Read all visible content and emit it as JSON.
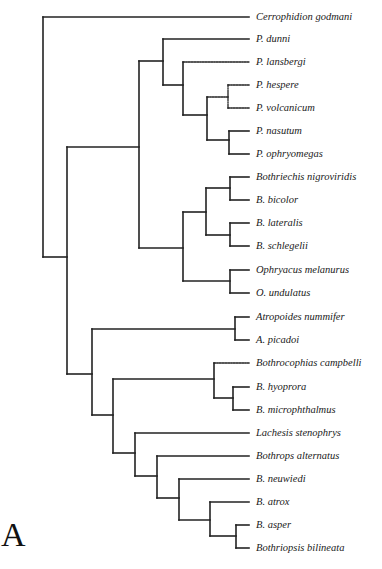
{
  "figure": {
    "panel_label": "A",
    "line_color": "#222222",
    "leaf_x_end": 249
  },
  "taxa": [
    {
      "name": "Cerrophidion godmani",
      "y": 17
    },
    {
      "name": "P. dunni",
      "y": 39
    },
    {
      "name": "P. lansbergi",
      "y": 62
    },
    {
      "name": "P. hespere",
      "y": 85
    },
    {
      "name": "P. volcanicum",
      "y": 108
    },
    {
      "name": "P. nasutum",
      "y": 131
    },
    {
      "name": "P. ophryomegas",
      "y": 154
    },
    {
      "name": "Bothriechis nigroviridis",
      "y": 177
    },
    {
      "name": "B. bicolor",
      "y": 200
    },
    {
      "name": "B. lateralis",
      "y": 223
    },
    {
      "name": "B. schlegelii",
      "y": 246
    },
    {
      "name": "Ophryacus melanurus",
      "y": 270
    },
    {
      "name": "O. undulatus",
      "y": 293
    },
    {
      "name": "Atropoides nummifer",
      "y": 317
    },
    {
      "name": "A. picadoi",
      "y": 340
    },
    {
      "name": "Bothrocophias campbelli",
      "y": 363
    },
    {
      "name": "B. hyoprora",
      "y": 387
    },
    {
      "name": "B. microphthalmus",
      "y": 410
    },
    {
      "name": "Lachesis stenophrys",
      "y": 433
    },
    {
      "name": "Bothrops alternatus",
      "y": 456
    },
    {
      "name": "B. neuwiedi",
      "y": 479
    },
    {
      "name": "B. atrox",
      "y": 502
    },
    {
      "name": "B. asper",
      "y": 525
    },
    {
      "name": "Bothriopsis bilineata",
      "y": 548
    }
  ],
  "nodes": [
    {
      "id": "root",
      "x": 43,
      "y1": 17,
      "y2": 257,
      "dotted": false
    },
    {
      "id": "n_ingroup",
      "x": 67,
      "y1": 147,
      "y2": 374,
      "dotted": false
    },
    {
      "id": "n_upper",
      "x": 139,
      "y1": 61,
      "y2": 248,
      "dotted": false
    },
    {
      "id": "n_porth",
      "x": 163,
      "y1": 39,
      "y2": 85,
      "dotted": false
    },
    {
      "id": "n_porth2",
      "x": 183,
      "y1": 62,
      "y2": 115,
      "dotted": false
    },
    {
      "id": "n_porth3",
      "x": 207,
      "y1": 97,
      "y2": 140,
      "dotted": false
    },
    {
      "id": "n_hesp",
      "x": 228,
      "y1": 85,
      "y2": 108,
      "dotted": true
    },
    {
      "id": "n_nas",
      "x": 229,
      "y1": 131,
      "y2": 154,
      "dotted": false
    },
    {
      "id": "n_bothr_oph",
      "x": 183,
      "y1": 212,
      "y2": 281,
      "dotted": false
    },
    {
      "id": "n_bothr",
      "x": 206,
      "y1": 188,
      "y2": 235,
      "dotted": false
    },
    {
      "id": "n_bn",
      "x": 230,
      "y1": 177,
      "y2": 200,
      "dotted": false
    },
    {
      "id": "n_bl",
      "x": 230,
      "y1": 223,
      "y2": 246,
      "dotted": false
    },
    {
      "id": "n_oph",
      "x": 230,
      "y1": 270,
      "y2": 293,
      "dotted": false
    },
    {
      "id": "n_lower",
      "x": 92,
      "y1": 329,
      "y2": 415,
      "dotted": false
    },
    {
      "id": "n_atro",
      "x": 235,
      "y1": 317,
      "y2": 340,
      "dotted": false
    },
    {
      "id": "n_lower2",
      "x": 113,
      "y1": 379,
      "y2": 453,
      "dotted": false
    },
    {
      "id": "n_bcoph",
      "x": 214,
      "y1": 363,
      "y2": 398,
      "dotted": false
    },
    {
      "id": "n_hyo",
      "x": 233,
      "y1": 387,
      "y2": 410,
      "dotted": false
    },
    {
      "id": "n_lach",
      "x": 135,
      "y1": 433,
      "y2": 476,
      "dotted": false
    },
    {
      "id": "n_bop1",
      "x": 157,
      "y1": 456,
      "y2": 498,
      "dotted": false
    },
    {
      "id": "n_bop2",
      "x": 179,
      "y1": 479,
      "y2": 520,
      "dotted": false
    },
    {
      "id": "n_bop3",
      "x": 210,
      "y1": 502,
      "y2": 536,
      "dotted": false
    },
    {
      "id": "n_asp",
      "x": 236,
      "y1": 525,
      "y2": 548,
      "dotted": false
    }
  ],
  "branches": [
    {
      "x1": 43,
      "x2": 249,
      "y": 17,
      "dotted": false
    },
    {
      "x1": 43,
      "x2": 67,
      "y": 257,
      "dotted": false
    },
    {
      "x1": 67,
      "x2": 139,
      "y": 147,
      "dotted": false
    },
    {
      "x1": 139,
      "x2": 163,
      "y": 61,
      "dotted": false
    },
    {
      "x1": 163,
      "x2": 249,
      "y": 39,
      "dotted": false
    },
    {
      "x1": 163,
      "x2": 183,
      "y": 85,
      "dotted": false
    },
    {
      "x1": 183,
      "x2": 249,
      "y": 62,
      "dotted": true
    },
    {
      "x1": 183,
      "x2": 207,
      "y": 115,
      "dotted": false
    },
    {
      "x1": 207,
      "x2": 228,
      "y": 97,
      "dotted": true
    },
    {
      "x1": 228,
      "x2": 249,
      "y": 85,
      "dotted": true
    },
    {
      "x1": 228,
      "x2": 249,
      "y": 108,
      "dotted": true
    },
    {
      "x1": 207,
      "x2": 229,
      "y": 140,
      "dotted": false
    },
    {
      "x1": 229,
      "x2": 249,
      "y": 131,
      "dotted": false
    },
    {
      "x1": 229,
      "x2": 249,
      "y": 154,
      "dotted": false
    },
    {
      "x1": 139,
      "x2": 183,
      "y": 248,
      "dotted": false
    },
    {
      "x1": 183,
      "x2": 206,
      "y": 212,
      "dotted": false
    },
    {
      "x1": 206,
      "x2": 230,
      "y": 188,
      "dotted": false
    },
    {
      "x1": 230,
      "x2": 249,
      "y": 177,
      "dotted": false
    },
    {
      "x1": 230,
      "x2": 249,
      "y": 200,
      "dotted": false
    },
    {
      "x1": 206,
      "x2": 230,
      "y": 235,
      "dotted": false
    },
    {
      "x1": 230,
      "x2": 249,
      "y": 223,
      "dotted": false
    },
    {
      "x1": 230,
      "x2": 249,
      "y": 246,
      "dotted": false
    },
    {
      "x1": 183,
      "x2": 230,
      "y": 281,
      "dotted": false
    },
    {
      "x1": 230,
      "x2": 249,
      "y": 270,
      "dotted": false
    },
    {
      "x1": 230,
      "x2": 249,
      "y": 293,
      "dotted": false
    },
    {
      "x1": 67,
      "x2": 92,
      "y": 374,
      "dotted": false
    },
    {
      "x1": 92,
      "x2": 235,
      "y": 329,
      "dotted": false
    },
    {
      "x1": 235,
      "x2": 249,
      "y": 317,
      "dotted": false
    },
    {
      "x1": 235,
      "x2": 249,
      "y": 340,
      "dotted": false
    },
    {
      "x1": 92,
      "x2": 113,
      "y": 415,
      "dotted": false
    },
    {
      "x1": 113,
      "x2": 214,
      "y": 379,
      "dotted": false
    },
    {
      "x1": 214,
      "x2": 249,
      "y": 363,
      "dotted": true
    },
    {
      "x1": 214,
      "x2": 233,
      "y": 398,
      "dotted": false
    },
    {
      "x1": 233,
      "x2": 249,
      "y": 387,
      "dotted": false
    },
    {
      "x1": 233,
      "x2": 249,
      "y": 410,
      "dotted": false
    },
    {
      "x1": 113,
      "x2": 135,
      "y": 453,
      "dotted": false
    },
    {
      "x1": 135,
      "x2": 249,
      "y": 433,
      "dotted": false
    },
    {
      "x1": 135,
      "x2": 157,
      "y": 476,
      "dotted": false
    },
    {
      "x1": 157,
      "x2": 249,
      "y": 456,
      "dotted": false
    },
    {
      "x1": 157,
      "x2": 179,
      "y": 498,
      "dotted": false
    },
    {
      "x1": 179,
      "x2": 249,
      "y": 479,
      "dotted": false
    },
    {
      "x1": 179,
      "x2": 210,
      "y": 520,
      "dotted": false
    },
    {
      "x1": 210,
      "x2": 249,
      "y": 502,
      "dotted": false
    },
    {
      "x1": 210,
      "x2": 236,
      "y": 536,
      "dotted": false
    },
    {
      "x1": 236,
      "x2": 249,
      "y": 525,
      "dotted": false
    },
    {
      "x1": 236,
      "x2": 249,
      "y": 548,
      "dotted": false
    }
  ]
}
